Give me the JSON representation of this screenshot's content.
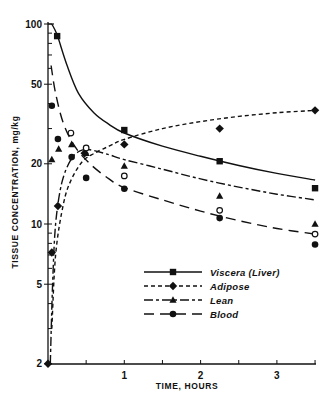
{
  "chart_data": {
    "type": "line",
    "title": "",
    "xlabel": "TIME, HOURS",
    "ylabel": "TISSUE CONCENTRATION, mg/kg",
    "xlim": [
      0,
      3.5
    ],
    "ylim": [
      2,
      100
    ],
    "yscale": "log",
    "xticks": [
      0.5,
      1,
      1.5,
      2,
      2.5,
      3,
      3.5
    ],
    "xtick_labels": [
      "",
      "1",
      "",
      "2",
      "",
      "3",
      ""
    ],
    "yticks_labeled": [
      100,
      50,
      20,
      10,
      5,
      2
    ],
    "ytick_labels": [
      "100",
      "50",
      "20",
      "10",
      "5",
      "2"
    ],
    "yticks_minor": [
      90,
      80,
      70,
      60,
      40,
      30,
      9,
      8,
      7,
      6,
      4,
      3
    ],
    "grid": false,
    "legend_position": "lower-right inside",
    "series": [
      {
        "name": "Viscera (Liver)",
        "marker": "square",
        "line_style": "solid",
        "points": [
          [
            0.12,
            87
          ],
          [
            1.0,
            29.5
          ],
          [
            2.25,
            20.6
          ],
          [
            3.5,
            15.1
          ]
        ],
        "curve": [
          [
            0.05,
            100
          ],
          [
            0.12,
            88
          ],
          [
            0.25,
            62
          ],
          [
            0.4,
            45
          ],
          [
            0.6,
            36
          ],
          [
            0.8,
            31.5
          ],
          [
            1.0,
            28.5
          ],
          [
            1.5,
            24.5
          ],
          [
            2.0,
            21.8
          ],
          [
            2.5,
            19.6
          ],
          [
            3.0,
            17.9
          ],
          [
            3.5,
            16.6
          ]
        ]
      },
      {
        "name": "Adipose",
        "marker": "diamond",
        "line_style": "short-dash",
        "points": [
          [
            0.0,
            2
          ],
          [
            0.05,
            7.2
          ],
          [
            0.13,
            12.3
          ],
          [
            0.48,
            22.6
          ],
          [
            1.0,
            25
          ],
          [
            2.25,
            30
          ],
          [
            3.5,
            37
          ]
        ],
        "curve": [
          [
            0.05,
            3
          ],
          [
            0.1,
            7
          ],
          [
            0.2,
            12.5
          ],
          [
            0.3,
            16.5
          ],
          [
            0.45,
            20.5
          ],
          [
            0.6,
            22.5
          ],
          [
            0.8,
            24.5
          ],
          [
            1.0,
            26.5
          ],
          [
            1.5,
            30
          ],
          [
            2.0,
            32.5
          ],
          [
            2.5,
            34.5
          ],
          [
            3.0,
            36
          ],
          [
            3.5,
            37
          ]
        ]
      },
      {
        "name": "Lean",
        "marker": "triangle",
        "line_style": "dash-dot",
        "points": [
          [
            0.05,
            21
          ],
          [
            0.14,
            23.7
          ],
          [
            0.31,
            25
          ],
          [
            0.5,
            22.6
          ],
          [
            1.0,
            19.5
          ],
          [
            2.25,
            13.8
          ],
          [
            3.5,
            10
          ]
        ],
        "curve": [
          [
            0.03,
            2
          ],
          [
            0.06,
            5
          ],
          [
            0.1,
            10
          ],
          [
            0.18,
            16
          ],
          [
            0.3,
            21
          ],
          [
            0.42,
            23.2
          ],
          [
            0.55,
            23.5
          ],
          [
            0.8,
            22.2
          ],
          [
            1.0,
            21
          ],
          [
            1.5,
            18.8
          ],
          [
            2.0,
            16.8
          ],
          [
            2.5,
            15.3
          ],
          [
            3.0,
            14.1
          ],
          [
            3.5,
            13.2
          ]
        ]
      },
      {
        "name": "Blood",
        "marker": "filled-circle",
        "line_style": "long-dash",
        "points": [
          [
            0.05,
            39
          ],
          [
            0.13,
            26.6
          ],
          [
            0.31,
            21.6
          ],
          [
            0.5,
            17
          ],
          [
            1.0,
            15
          ],
          [
            2.25,
            10.7
          ],
          [
            3.5,
            7.9
          ]
        ],
        "curve": [
          [
            0.04,
            62
          ],
          [
            0.1,
            45
          ],
          [
            0.2,
            32
          ],
          [
            0.35,
            24.5
          ],
          [
            0.55,
            20
          ],
          [
            0.8,
            16.8
          ],
          [
            1.0,
            15.2
          ],
          [
            1.5,
            13.2
          ],
          [
            2.0,
            11.6
          ],
          [
            2.5,
            10.4
          ],
          [
            3.0,
            9.5
          ],
          [
            3.5,
            8.9
          ]
        ]
      },
      {
        "name": "(unlabeled open circles)",
        "marker": "open-circle",
        "line_style": "none",
        "points": [
          [
            0.3,
            28.5
          ],
          [
            0.5,
            24
          ],
          [
            1.0,
            17.4
          ],
          [
            2.25,
            11.7
          ],
          [
            3.5,
            8.9
          ]
        ]
      }
    ]
  },
  "legend": {
    "items": [
      {
        "label": "Viscera (Liver)",
        "dash": "",
        "marker": "square"
      },
      {
        "label": "Adipose",
        "dash": "4,3",
        "marker": "diamond"
      },
      {
        "label": "Lean",
        "dash": "9,3,3,3",
        "marker": "triangle"
      },
      {
        "label": "Blood",
        "dash": "10,6",
        "marker": "circle"
      }
    ]
  }
}
